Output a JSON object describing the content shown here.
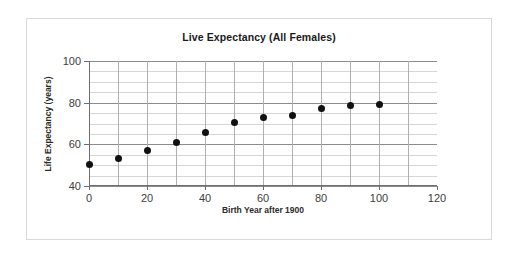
{
  "chart_data": {
    "type": "scatter",
    "title": "Live Expectancy (All Females)",
    "xlabel": "Birth Year after 1900",
    "ylabel": "Life Expectancy (years)",
    "xlim": [
      0,
      120
    ],
    "ylim": [
      40,
      100
    ],
    "xticks": [
      "0",
      "20",
      "40",
      "60",
      "80",
      "100",
      "120"
    ],
    "xtick_values": [
      0,
      20,
      40,
      60,
      80,
      100,
      120
    ],
    "yticks": [
      "100",
      "80",
      "60",
      "40"
    ],
    "ytick_values": [
      100,
      80,
      60,
      40
    ],
    "grid": "horizontal-minor-every-5-and-vertical-every-10",
    "legend": "none",
    "marker_color": "#111111",
    "x": [
      0,
      10,
      20,
      30,
      40,
      50,
      60,
      70,
      80,
      90,
      100
    ],
    "values": [
      50.5,
      53.0,
      57.0,
      61.0,
      65.5,
      70.5,
      73.0,
      74.0,
      77.0,
      78.5,
      79.0
    ],
    "series": [
      {
        "name": "All Females",
        "values": [
          50.5,
          53.0,
          57.0,
          61.0,
          65.5,
          70.5,
          73.0,
          74.0,
          77.0,
          78.5,
          79.0
        ]
      }
    ],
    "points": [
      {
        "x": 0,
        "y": 50.5
      },
      {
        "x": 10,
        "y": 53.0
      },
      {
        "x": 20,
        "y": 57.0
      },
      {
        "x": 30,
        "y": 61.0
      },
      {
        "x": 40,
        "y": 65.5
      },
      {
        "x": 50,
        "y": 70.5
      },
      {
        "x": 60,
        "y": 73.0
      },
      {
        "x": 70,
        "y": 74.0
      },
      {
        "x": 80,
        "y": 77.0
      },
      {
        "x": 90,
        "y": 78.5
      },
      {
        "x": 100,
        "y": 79.0
      }
    ]
  }
}
